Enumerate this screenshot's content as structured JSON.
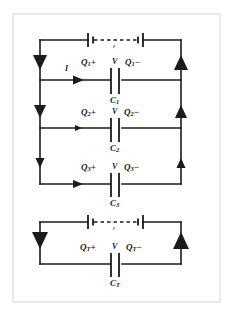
{
  "figure": {
    "background": "#ffffff",
    "frame_color": "#e9e9e9",
    "wire_color": "#1b1b1b"
  },
  "parallel_circuit": {
    "name": "parallel-capacitor-network",
    "source": {
      "label": "ε",
      "name": "emf-source-top"
    },
    "current": {
      "label": "I",
      "name": "current-label"
    },
    "branches": [
      {
        "charge_positive": "Q",
        "charge_positive_sub": "1",
        "plus": "+",
        "voltage": "V",
        "charge_negative": "Q",
        "charge_negative_sub": "1",
        "minus": "−",
        "capacitor": "C",
        "capacitor_sub": "1"
      },
      {
        "charge_positive": "Q",
        "charge_positive_sub": "2",
        "plus": "+",
        "voltage": "V",
        "charge_negative": "Q",
        "charge_negative_sub": "2",
        "minus": "−",
        "capacitor": "C",
        "capacitor_sub": "2"
      },
      {
        "charge_positive": "Q",
        "charge_positive_sub": "3",
        "plus": "+",
        "voltage": "V",
        "charge_negative": "Q",
        "charge_negative_sub": "3",
        "minus": "−",
        "capacitor": "C",
        "capacitor_sub": "3"
      }
    ]
  },
  "equivalent_circuit": {
    "name": "equivalent-capacitor-circuit",
    "source": {
      "label": "ε",
      "name": "emf-source-bottom"
    },
    "branch": {
      "charge_positive": "Q",
      "charge_positive_sub": "T",
      "plus": "+",
      "voltage": "V",
      "charge_negative": "Q",
      "charge_negative_sub": "T",
      "minus": "−",
      "capacitor": "C",
      "capacitor_sub": "T"
    }
  }
}
